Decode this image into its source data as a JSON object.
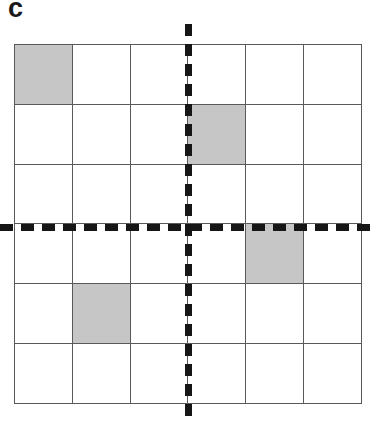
{
  "panel": {
    "label": "c",
    "label_color": "#1a1a1a",
    "background": "#ffffff"
  },
  "grid": {
    "rows": 6,
    "columns": 6,
    "line_color": "#595959",
    "cell_fill_empty": "#ffffff",
    "cell_fill_shaded": "#c6c6c6",
    "shaded_cells": [
      {
        "row": 0,
        "col": 0
      },
      {
        "row": 1,
        "col": 3
      },
      {
        "row": 3,
        "col": 4
      },
      {
        "row": 4,
        "col": 1
      }
    ],
    "cells": [
      [
        1,
        0,
        0,
        0,
        0,
        0
      ],
      [
        0,
        0,
        0,
        1,
        0,
        0
      ],
      [
        0,
        0,
        0,
        0,
        0,
        0
      ],
      [
        0,
        0,
        0,
        0,
        1,
        0
      ],
      [
        0,
        1,
        0,
        0,
        0,
        0
      ],
      [
        0,
        0,
        0,
        0,
        0,
        0
      ]
    ]
  },
  "axes": {
    "vertical": {
      "name": "vertical-dashed-axis",
      "style": "dashed",
      "color": "#161616",
      "position_column_boundary": 3
    },
    "horizontal": {
      "name": "horizontal-dashed-axis",
      "style": "dashed",
      "color": "#161616",
      "position_row_boundary": 3
    }
  },
  "chart_data": {
    "type": "heatmap",
    "title": "c",
    "xlabel": "",
    "ylabel": "",
    "categories_x": [
      "1",
      "2",
      "3",
      "4",
      "5",
      "6"
    ],
    "categories_y": [
      "1",
      "2",
      "3",
      "4",
      "5",
      "6"
    ],
    "values": [
      [
        1,
        0,
        0,
        0,
        0,
        0
      ],
      [
        0,
        0,
        0,
        1,
        0,
        0
      ],
      [
        0,
        0,
        0,
        0,
        0,
        0
      ],
      [
        0,
        0,
        0,
        0,
        1,
        0
      ],
      [
        0,
        1,
        0,
        0,
        0,
        0
      ],
      [
        0,
        0,
        0,
        0,
        0,
        0
      ]
    ],
    "value_legend": {
      "0": "unshaded",
      "1": "shaded"
    },
    "grid": true,
    "legend": "none",
    "annotations": [
      "vertical dashed axis between column 3 and column 4",
      "horizontal dashed axis between row 3 and row 4"
    ]
  }
}
